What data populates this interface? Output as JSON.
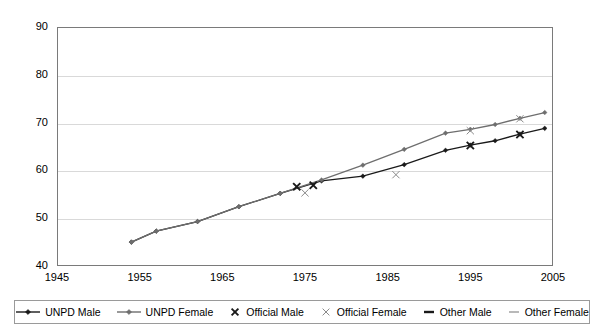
{
  "chart_data": {
    "type": "line",
    "title": "",
    "xlabel": "",
    "ylabel": "",
    "xlim": [
      1945,
      2005
    ],
    "ylim": [
      40,
      90
    ],
    "xticks": [
      1945,
      1955,
      1965,
      1975,
      1985,
      1995,
      2005
    ],
    "yticks": [
      40,
      50,
      60,
      70,
      80,
      90
    ],
    "grid": "horizontal",
    "legend_position": "bottom",
    "series": [
      {
        "name": "UNPD Male",
        "type": "line",
        "color": "#1a1a1a",
        "marker": "diamond",
        "points": [
          [
            1954,
            45.0
          ],
          [
            1957,
            47.3
          ],
          [
            1962,
            49.3
          ],
          [
            1967,
            52.4
          ],
          [
            1972,
            55.2
          ],
          [
            1977,
            57.8
          ],
          [
            1982,
            58.8
          ],
          [
            1987,
            61.2
          ],
          [
            1992,
            64.2
          ],
          [
            1995,
            65.3
          ],
          [
            1998,
            66.2
          ],
          [
            2001,
            67.6
          ],
          [
            2004,
            68.8
          ]
        ]
      },
      {
        "name": "UNPD Female",
        "type": "line",
        "color": "#6e6e6e",
        "marker": "diamond",
        "points": [
          [
            1954,
            45.0
          ],
          [
            1957,
            47.3
          ],
          [
            1962,
            49.3
          ],
          [
            1967,
            52.4
          ],
          [
            1972,
            55.2
          ],
          [
            1977,
            58.0
          ],
          [
            1982,
            61.1
          ],
          [
            1987,
            64.4
          ],
          [
            1992,
            67.8
          ],
          [
            1995,
            68.6
          ],
          [
            1998,
            69.6
          ],
          [
            2001,
            70.9
          ],
          [
            2004,
            72.1
          ]
        ]
      },
      {
        "name": "Official Male",
        "type": "scatter",
        "color": "#1a1a1a",
        "marker": "x-bold",
        "points": [
          [
            1974,
            56.6
          ],
          [
            1976,
            56.9
          ],
          [
            1995,
            65.2
          ],
          [
            2001,
            67.5
          ]
        ]
      },
      {
        "name": "Official Female",
        "type": "scatter",
        "color": "#8a8a8a",
        "marker": "x-thin",
        "points": [
          [
            1975,
            55.3
          ],
          [
            1986,
            59.1
          ],
          [
            1995,
            68.3
          ],
          [
            2001,
            70.8
          ]
        ]
      },
      {
        "name": "Other Male",
        "type": "scatter",
        "color": "#1a1a1a",
        "marker": "dash-bold",
        "points": []
      },
      {
        "name": "Other Female",
        "type": "scatter",
        "color": "#8a8a8a",
        "marker": "dash-thin",
        "points": []
      }
    ]
  },
  "legend": {
    "items": [
      {
        "label": "UNPD Male",
        "key": "line-diamond-dark",
        "icon": "line-with-diamond-marker-icon"
      },
      {
        "label": "UNPD Female",
        "key": "line-diamond-grey",
        "icon": "line-with-diamond-marker-icon"
      },
      {
        "label": "Official Male",
        "key": "x-bold",
        "icon": "x-marker-icon"
      },
      {
        "label": "Official Female",
        "key": "x-thin",
        "icon": "x-marker-icon"
      },
      {
        "label": "Other Male",
        "key": "dash-bold",
        "icon": "dash-marker-icon"
      },
      {
        "label": "Other Female",
        "key": "dash-thin",
        "icon": "dash-marker-icon"
      }
    ]
  },
  "colors": {
    "series_male": "#1a1a1a",
    "series_female": "#6e6e6e",
    "marker_official_female": "#8a8a8a",
    "gridline": "#d9d9d9",
    "frame": "#7a7a7a",
    "background": "#ffffff"
  }
}
